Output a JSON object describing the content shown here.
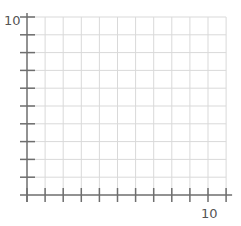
{
  "chart_data": {
    "type": "scatter",
    "title": "",
    "xlabel": "",
    "ylabel": "",
    "xlim": [
      0,
      11
    ],
    "ylim": [
      0,
      10
    ],
    "x_ticks": [
      0,
      1,
      2,
      3,
      4,
      5,
      6,
      7,
      8,
      9,
      10,
      11
    ],
    "y_ticks": [
      1,
      2,
      3,
      4,
      5,
      6,
      7,
      8,
      9,
      10
    ],
    "x_tick_labels": [
      {
        "value": 10,
        "label": "10"
      }
    ],
    "y_tick_labels": [
      {
        "value": 10,
        "label": "10"
      }
    ],
    "grid": true,
    "series": [],
    "legend": null
  },
  "colors": {
    "axis": "#6e6e6e",
    "grid": "#d9d9d9",
    "label": "#555555",
    "background": "#ffffff"
  },
  "labels": {
    "x_max": "10",
    "y_max": "10"
  }
}
